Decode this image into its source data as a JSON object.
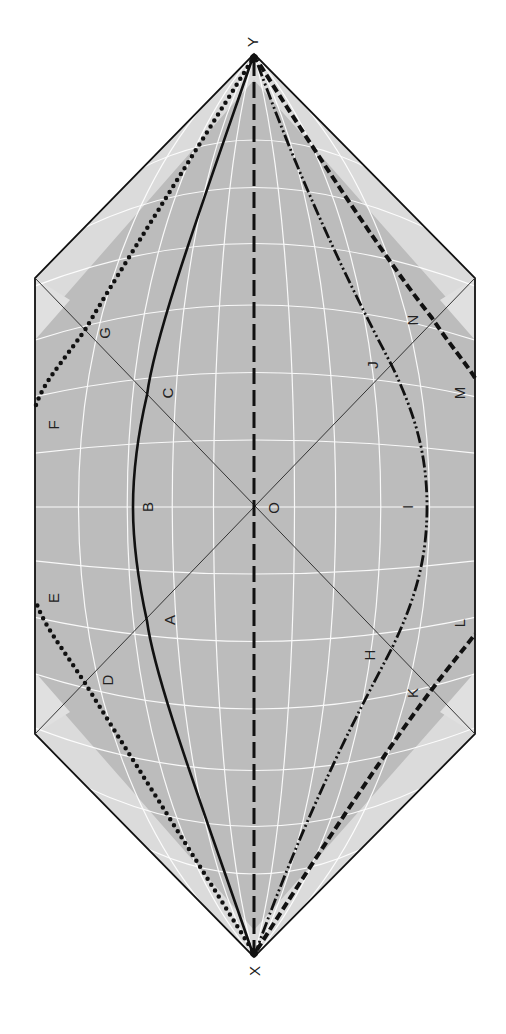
{
  "diagram": {
    "type": "spacetime-conformal-diagram",
    "orientation": "rotated-90",
    "colors": {
      "fill": "#bcbcbc",
      "grid": "#ffffff",
      "outline": "#111111",
      "curves": "#111111",
      "background": "#ffffff"
    },
    "vertices": {
      "X": {
        "label": "X",
        "x": 254,
        "y": 957
      },
      "Y": {
        "label": "Y",
        "x": 254,
        "y": 54
      },
      "O": {
        "label": "O",
        "x": 254,
        "y": 507
      }
    },
    "points": [
      {
        "id": "A",
        "label": "A",
        "x": 147,
        "y": 621
      },
      {
        "id": "B",
        "label": "B",
        "x": 133,
        "y": 507
      },
      {
        "id": "C",
        "label": "C",
        "x": 147,
        "y": 395
      },
      {
        "id": "D",
        "label": "D",
        "x": 85,
        "y": 683
      },
      {
        "id": "E",
        "label": "E",
        "x": 36,
        "y": 602
      },
      {
        "id": "F",
        "label": "F",
        "x": 36,
        "y": 405
      },
      {
        "id": "G",
        "label": "G",
        "x": 85,
        "y": 330
      },
      {
        "id": "H",
        "label": "H",
        "x": 392,
        "y": 648
      },
      {
        "id": "I",
        "label": "I",
        "x": 427,
        "y": 507
      },
      {
        "id": "J",
        "label": "J",
        "x": 392,
        "y": 366
      },
      {
        "id": "K",
        "label": "K",
        "x": 430,
        "y": 692
      },
      {
        "id": "L",
        "label": "L",
        "x": 475,
        "y": 634
      },
      {
        "id": "M",
        "label": "M",
        "x": 475,
        "y": 378
      },
      {
        "id": "N",
        "label": "N",
        "x": 432,
        "y": 318
      }
    ],
    "curves": [
      {
        "name": "solid-curve",
        "style": "solid",
        "through": [
          "X",
          "A",
          "B",
          "C",
          "Y"
        ]
      },
      {
        "name": "dotted-curve-lower",
        "style": "dotted",
        "through": [
          "X",
          "D",
          "E"
        ]
      },
      {
        "name": "dotted-curve-upper",
        "style": "dotted",
        "through": [
          "F",
          "G",
          "Y"
        ]
      },
      {
        "name": "dashed-axis",
        "style": "dashed",
        "through": [
          "X",
          "O",
          "Y"
        ]
      },
      {
        "name": "dash-dot-curve",
        "style": "dash-dot",
        "through": [
          "X",
          "H",
          "I",
          "J",
          "Y"
        ]
      },
      {
        "name": "dashed-curve-lower",
        "style": "dashed-heavy",
        "through": [
          "X",
          "K",
          "L"
        ]
      },
      {
        "name": "dashed-curve-upper",
        "style": "dashed-heavy",
        "through": [
          "M",
          "N",
          "Y"
        ]
      }
    ]
  },
  "labels": {
    "X": "X",
    "Y": "Y",
    "O": "O",
    "A": "A",
    "B": "B",
    "C": "C",
    "D": "D",
    "E": "E",
    "F": "F",
    "G": "G",
    "H": "H",
    "I": "I",
    "J": "J",
    "K": "K",
    "L": "L",
    "M": "M",
    "N": "N"
  }
}
